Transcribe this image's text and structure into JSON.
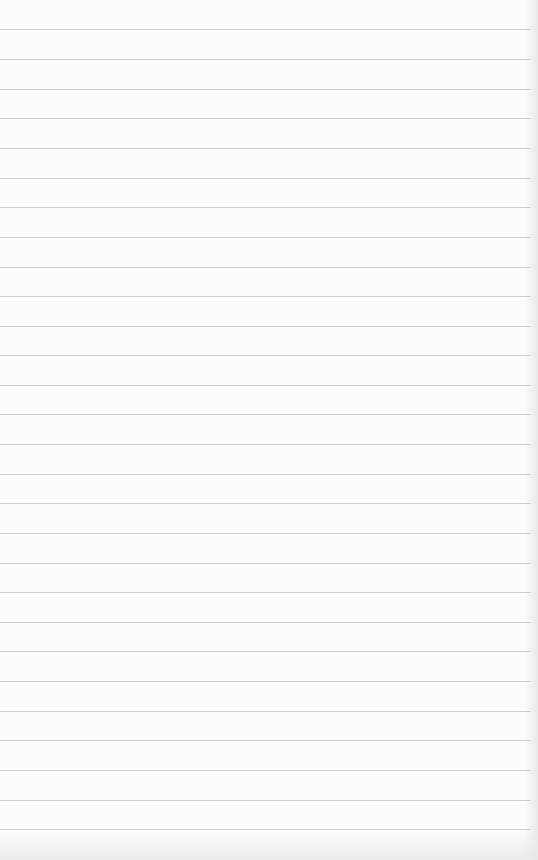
{
  "document": {
    "type": "lined-notepaper",
    "background_color": "#fcfcfc",
    "rule_color": "#cfcfcf",
    "ruled_lines": [
      29,
      59,
      89,
      118,
      148,
      178,
      207,
      237,
      267,
      296,
      326,
      355,
      385,
      414,
      444,
      474,
      503,
      533,
      563,
      592,
      622,
      651,
      681,
      711,
      740,
      770,
      800,
      829
    ],
    "handwritten_content": []
  }
}
